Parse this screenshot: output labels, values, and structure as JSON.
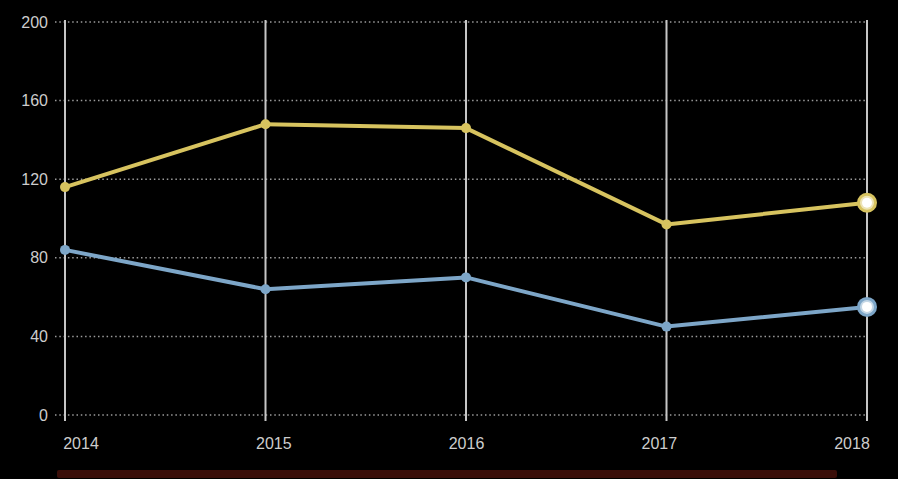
{
  "chart_data": {
    "type": "line",
    "title": "",
    "xlabel": "",
    "ylabel": "",
    "x_categories": [
      "2014",
      "2015",
      "2016",
      "2017",
      "2018"
    ],
    "series": [
      {
        "name": "gold-series",
        "color": "#d7c35f",
        "values": [
          116,
          148,
          146,
          97,
          108
        ]
      },
      {
        "name": "blue-series",
        "color": "#7da6c8",
        "values": [
          84,
          64,
          70,
          45,
          55
        ]
      }
    ],
    "ylim": [
      0,
      200
    ],
    "yticks": [
      0,
      40,
      80,
      120,
      160,
      200
    ],
    "grid": {
      "horizontal": "dotted",
      "vertical": "solid"
    },
    "legend": "none",
    "endpoint_highlight": "last point of each series drawn as colored ring with white glowing center"
  },
  "colors": {
    "background": "#000000",
    "grid_dotted": "#9b9b9b",
    "grid_vertical": "#c6c6c6",
    "tick_label": "#cdcdcd",
    "gold_line": "#d7c35f",
    "blue_line": "#7da6c8",
    "marker_center": "#ffffff",
    "bottom_strip": "#3a0e09"
  }
}
